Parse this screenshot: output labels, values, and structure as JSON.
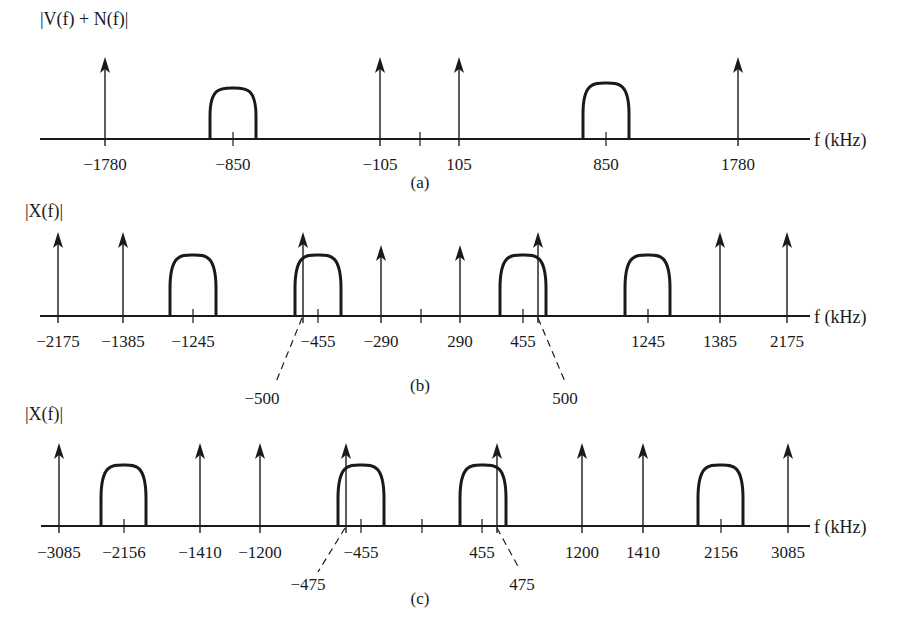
{
  "figure": {
    "panels": [
      {
        "id": "a",
        "caption": "(a)",
        "ylabel": "|V(f) + N(f)|",
        "xlabel": "f (kHz)",
        "axis_y": 139,
        "axis_x0": 40,
        "axis_x1": 810,
        "center_x": 420,
        "impulse_top": 57,
        "bump_top": 88,
        "label_y": 164,
        "caption_x": 420,
        "caption_y": 188,
        "ylabel_x": 40,
        "ylabel_y": 25,
        "impulses": [
          {
            "freq": -1780,
            "x": 105,
            "top": 57,
            "label": "−1780"
          },
          {
            "freq": -105,
            "x": 380,
            "top": 57,
            "label": "−105"
          },
          {
            "freq": 105,
            "x": 459,
            "top": 57,
            "label": "105"
          },
          {
            "freq": 1780,
            "x": 738,
            "top": 57,
            "label": "1780"
          }
        ],
        "bumps": [
          {
            "center_freq": -850,
            "x0": 210,
            "x1": 256,
            "cx": 233,
            "top": 88,
            "label": "−850"
          },
          {
            "center_freq": 850,
            "x0": 583,
            "x1": 629,
            "cx": 606,
            "top": 83,
            "label": "850"
          }
        ],
        "annotations": []
      },
      {
        "id": "b",
        "caption": "(b)",
        "ylabel": "|X(f)|",
        "xlabel": "f (kHz)",
        "axis_y": 316,
        "axis_x0": 40,
        "axis_x1": 810,
        "center_x": 421,
        "label_y": 341,
        "caption_x": 420,
        "caption_y": 391,
        "ylabel_x": 25,
        "ylabel_y": 217,
        "impulses": [
          {
            "freq": -2175,
            "x": 58,
            "top": 232,
            "label": "−2175"
          },
          {
            "freq": -1385,
            "x": 123,
            "top": 232,
            "label": "−1385"
          },
          {
            "freq": -500,
            "x": 303,
            "top": 232,
            "label": ""
          },
          {
            "freq": -290,
            "x": 381,
            "top": 245,
            "label": "−290"
          },
          {
            "freq": 290,
            "x": 460,
            "top": 245,
            "label": "290"
          },
          {
            "freq": 500,
            "x": 538,
            "top": 232,
            "label": ""
          },
          {
            "freq": 1385,
            "x": 720,
            "top": 232,
            "label": "1385"
          },
          {
            "freq": 2175,
            "x": 787,
            "top": 232,
            "label": "2175"
          }
        ],
        "bumps": [
          {
            "center_freq": -1245,
            "x0": 170,
            "x1": 216,
            "cx": 193,
            "top": 255,
            "label": "−1245"
          },
          {
            "center_freq": -455,
            "x0": 295,
            "x1": 341,
            "cx": 318,
            "top": 255,
            "label": "−455"
          },
          {
            "center_freq": 455,
            "x0": 500,
            "x1": 546,
            "cx": 523,
            "top": 255,
            "label": "455"
          },
          {
            "center_freq": 1245,
            "x0": 625,
            "x1": 670,
            "cx": 648,
            "top": 255,
            "label": "1245"
          }
        ],
        "annotations": [
          {
            "label": "−500",
            "from_x": 302,
            "from_y": 318,
            "to_x": 276,
            "to_y": 382,
            "text_x": 262,
            "text_y": 404
          },
          {
            "label": "500",
            "from_x": 538,
            "from_y": 318,
            "to_x": 566,
            "to_y": 384,
            "text_x": 565,
            "text_y": 404
          }
        ]
      },
      {
        "id": "c",
        "caption": "(c)",
        "ylabel": "|X(f)|",
        "xlabel": "f (kHz)",
        "axis_y": 526,
        "axis_x0": 41,
        "axis_x1": 810,
        "center_x": 422,
        "label_y": 552,
        "caption_x": 420,
        "caption_y": 604,
        "ylabel_x": 25,
        "ylabel_y": 420,
        "impulses": [
          {
            "freq": -3085,
            "x": 59,
            "top": 443,
            "label": "−3085"
          },
          {
            "freq": -1410,
            "x": 200,
            "top": 443,
            "label": "−1410"
          },
          {
            "freq": -1200,
            "x": 260,
            "top": 443,
            "label": "−1200"
          },
          {
            "freq": -475,
            "x": 346,
            "top": 443,
            "label": ""
          },
          {
            "freq": 475,
            "x": 497,
            "top": 443,
            "label": ""
          },
          {
            "freq": 1200,
            "x": 582,
            "top": 443,
            "label": "1200"
          },
          {
            "freq": 1410,
            "x": 643,
            "top": 443,
            "label": "1410"
          },
          {
            "freq": 3085,
            "x": 788,
            "top": 443,
            "label": "3085"
          }
        ],
        "bumps": [
          {
            "center_freq": -2156,
            "x0": 101,
            "x1": 146,
            "cx": 124,
            "top": 465,
            "label": "−2156"
          },
          {
            "center_freq": -455,
            "x0": 338,
            "x1": 384,
            "cx": 361,
            "top": 465,
            "label": "−455"
          },
          {
            "center_freq": 455,
            "x0": 460,
            "x1": 506,
            "cx": 482,
            "top": 465,
            "label": "455"
          },
          {
            "center_freq": 2156,
            "x0": 698,
            "x1": 743,
            "cx": 721,
            "top": 465,
            "label": "2156"
          }
        ],
        "annotations": [
          {
            "label": "−475",
            "from_x": 345,
            "from_y": 528,
            "to_x": 318,
            "to_y": 572,
            "text_x": 308,
            "text_y": 590
          },
          {
            "label": "475",
            "from_x": 497,
            "from_y": 528,
            "to_x": 520,
            "to_y": 570,
            "text_x": 522,
            "text_y": 590
          }
        ]
      }
    ]
  }
}
